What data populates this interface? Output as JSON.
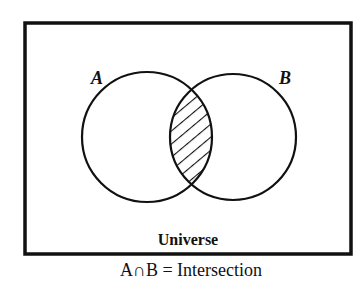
{
  "diagram": {
    "type": "venn",
    "sets": [
      {
        "name": "A",
        "label": "A"
      },
      {
        "name": "B",
        "label": "B"
      }
    ],
    "highlighted_region": "A∩B",
    "universe_label": "Universe",
    "caption": "A∩B = Intersection",
    "colors": {
      "stroke": "#111111",
      "background": "#ffffff",
      "hatch": "#111111"
    }
  }
}
